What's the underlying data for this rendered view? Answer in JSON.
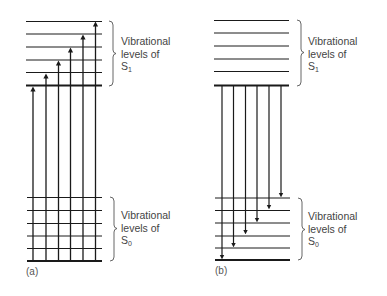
{
  "figure": {
    "panels": [
      {
        "id": "a",
        "label": "(a)",
        "process": "absorption",
        "arrow_direction": "up",
        "upper_state": {
          "name": "S",
          "subscript": "1",
          "caption_lines": [
            "Vibrational",
            "levels of"
          ]
        },
        "lower_state": {
          "name": "S",
          "subscript": "0",
          "caption_lines": [
            "Vibrational",
            "levels of"
          ]
        }
      },
      {
        "id": "b",
        "label": "(b)",
        "process": "emission",
        "arrow_direction": "down",
        "upper_state": {
          "name": "S",
          "subscript": "1",
          "caption_lines": [
            "Vibrational",
            "levels of"
          ]
        },
        "lower_state": {
          "name": "S",
          "subscript": "0",
          "caption_lines": [
            "Vibrational",
            "levels of"
          ]
        }
      }
    ],
    "levels_per_state": 6,
    "transitions_per_panel": 6,
    "colors": {
      "line": "#1a1a1a",
      "text": "#444444",
      "background": "#ffffff"
    }
  }
}
